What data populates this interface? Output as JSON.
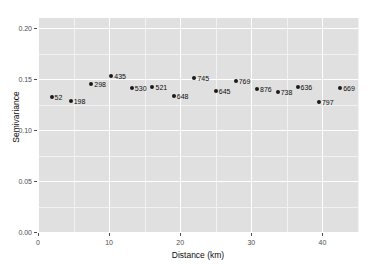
{
  "chart_data": {
    "type": "scatter",
    "title": "",
    "xlabel": "Distance (km)",
    "ylabel": "Semivariance",
    "xlim": [
      0,
      45
    ],
    "ylim": [
      0,
      0.21
    ],
    "grid": true,
    "legend": "none",
    "x_ticks": [
      "0",
      "10",
      "20",
      "30",
      "40"
    ],
    "x_tick_values": [
      0,
      10,
      20,
      30,
      40
    ],
    "y_ticks": [
      "0.00",
      "0.05",
      "0.10",
      "0.15",
      "0.20"
    ],
    "y_tick_values": [
      0.0,
      0.05,
      0.1,
      0.15,
      0.2
    ],
    "point_label_note": "np (number of point pairs) per lag",
    "points": [
      {
        "label": "52",
        "x": 1.9,
        "y": 0.1325
      },
      {
        "label": "198",
        "x": 4.6,
        "y": 0.1285
      },
      {
        "label": "298",
        "x": 7.5,
        "y": 0.1455
      },
      {
        "label": "435",
        "x": 10.3,
        "y": 0.1535
      },
      {
        "label": "530",
        "x": 13.2,
        "y": 0.141
      },
      {
        "label": "521",
        "x": 16.1,
        "y": 0.142
      },
      {
        "label": "648",
        "x": 19.1,
        "y": 0.133
      },
      {
        "label": "745",
        "x": 22.0,
        "y": 0.1515
      },
      {
        "label": "645",
        "x": 25.0,
        "y": 0.138
      },
      {
        "label": "769",
        "x": 27.8,
        "y": 0.148
      },
      {
        "label": "876",
        "x": 30.8,
        "y": 0.1405
      },
      {
        "label": "738",
        "x": 33.7,
        "y": 0.137
      },
      {
        "label": "636",
        "x": 36.5,
        "y": 0.142
      },
      {
        "label": "797",
        "x": 39.5,
        "y": 0.1275
      },
      {
        "label": "669",
        "x": 42.5,
        "y": 0.141
      }
    ]
  },
  "colors": {
    "panel_background": "#e0e0e0",
    "major_gridline": "#ffffff",
    "minor_gridline": "#f2f2f2",
    "point": "#1a1a1a",
    "axis_text": "#4d4d4d",
    "title_text": "#0d0d0d"
  }
}
